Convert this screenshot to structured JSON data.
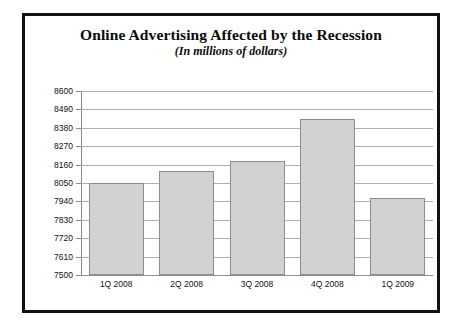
{
  "chart_data": {
    "type": "bar",
    "title": "Online Advertising Affected by the Recession",
    "subtitle": "(In millions of dollars)",
    "xlabel": "",
    "ylabel": "",
    "categories": [
      "1Q 2008",
      "2Q 2008",
      "3Q 2008",
      "4Q 2008",
      "1Q 2009"
    ],
    "values": [
      8050,
      8120,
      8180,
      8430,
      7960
    ],
    "ylim": [
      7500,
      8600
    ],
    "ytick_step": 110,
    "yticks": [
      8600,
      8490,
      8380,
      8270,
      8160,
      8050,
      7940,
      7830,
      7720,
      7610,
      7500
    ],
    "ytick_labels": [
      "8600",
      "8490",
      "8380",
      "8270",
      "8160",
      "8050",
      "7940",
      "7830",
      "7720",
      "7610",
      "7500"
    ],
    "grid": true,
    "legend": false,
    "bar_color": "#d2d2d2",
    "bar_border_color": "#8d8d8d",
    "grid_color": "#b0b0b0",
    "frame_color": "#111111",
    "background": "#ffffff"
  }
}
